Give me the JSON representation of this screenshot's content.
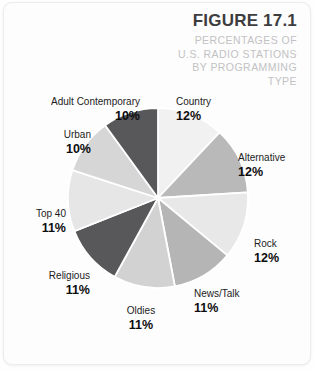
{
  "figure": {
    "title": "FIGURE 17.1",
    "subtitle_lines": [
      "PERCENTAGES OF",
      "U.S. RADIO STATIONS",
      "BY PROGRAMMING",
      "TYPE"
    ]
  },
  "chart_data": {
    "type": "pie",
    "title": "FIGURE 17.1",
    "subtitle": "PERCENTAGES OF U.S. RADIO STATIONS BY PROGRAMMING TYPE",
    "xlabel": "",
    "ylabel": "",
    "unit": "%",
    "legend_position": "none",
    "labels_outside": true,
    "start_angle_deg": -90,
    "direction": "clockwise",
    "categories": [
      "Country",
      "Alternative",
      "Rock",
      "News/Talk",
      "Oldies",
      "Religious",
      "Top 40",
      "Urban",
      "Adult Contemporary"
    ],
    "values": [
      12,
      12,
      12,
      11,
      11,
      11,
      11,
      10,
      10
    ],
    "value_labels": [
      "12%",
      "12%",
      "12%",
      "11%",
      "11%",
      "11%",
      "11%",
      "10%",
      "10%"
    ],
    "colors": [
      "#f1f1f1",
      "#b9b9b9",
      "#e8e8e8",
      "#b5b5b5",
      "#d2d2d2",
      "#58585a",
      "#e6e6e6",
      "#d6d6d6",
      "#58585a"
    ],
    "slice_border_color": "#ffffff",
    "total": 100
  },
  "slice_labels": {
    "country": {
      "name": "Country",
      "pct": "12%"
    },
    "alternative": {
      "name": "Alternative",
      "pct": "12%"
    },
    "rock": {
      "name": "Rock",
      "pct": "12%"
    },
    "news_talk": {
      "name": "News/Talk",
      "pct": "11%"
    },
    "oldies": {
      "name": "Oldies",
      "pct": "11%"
    },
    "religious": {
      "name": "Religious",
      "pct": "11%"
    },
    "top_40": {
      "name": "Top 40",
      "pct": "11%"
    },
    "urban": {
      "name": "Urban",
      "pct": "10%"
    },
    "adult_contemporary": {
      "name": "Adult Contemporary",
      "pct": "10%"
    }
  }
}
